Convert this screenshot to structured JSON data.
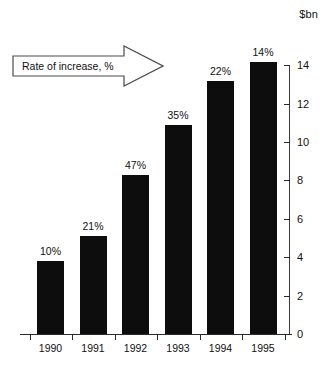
{
  "chart_data": {
    "type": "bar",
    "title": "",
    "subtitle": "",
    "xlabel": "",
    "ylabel": "$bn",
    "categories": [
      "1990",
      "1991",
      "1992",
      "1993",
      "1994",
      "1995"
    ],
    "values": [
      3.8,
      5.1,
      8.3,
      10.9,
      13.2,
      14.2
    ],
    "data_labels": [
      "10%",
      "21%",
      "47%",
      "35%",
      "22%",
      "14%"
    ],
    "series": [
      {
        "name": "Value",
        "values": [
          3.8,
          5.1,
          8.3,
          10.9,
          13.2,
          14.2
        ]
      },
      {
        "name": "Rate of increase, %",
        "values": [
          10,
          21,
          47,
          35,
          22,
          14
        ]
      }
    ],
    "ylim": [
      0,
      14.8
    ],
    "yticks": [
      0,
      2,
      4,
      6,
      8,
      10,
      12,
      14
    ],
    "ytick_labels": [
      "0",
      "2",
      "4",
      "6",
      "8",
      "10",
      "12",
      "14"
    ],
    "grid": false,
    "legend": false,
    "legend_position": "none",
    "annotations": [
      {
        "text": "Rate of increase, %",
        "shape": "right-arrow",
        "position": "upper-left"
      }
    ],
    "bar_color": "#0d0d0d",
    "background_color": "#ffffff",
    "axis_color": "#2b2b2b",
    "text_color": "#111111"
  },
  "axis": {
    "unit_label": "$bn"
  },
  "callout": {
    "text": "Rate of increase, %"
  }
}
